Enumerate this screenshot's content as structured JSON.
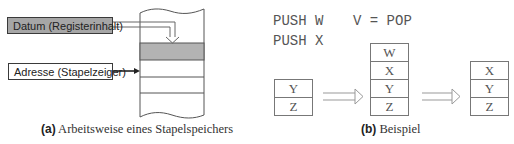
{
  "figure_a": {
    "datum_label": "Datum (Registerinhalt)",
    "address_label": "Adresse (Stapelzeiger)",
    "caption_tag": "(a)",
    "caption_text": " Arbeitsweise eines Stapelspeichers",
    "colors": {
      "datum_fill": "#a6a6a6",
      "highlight_row": "#b3b3b3"
    }
  },
  "figure_b": {
    "code": {
      "line1_left": "PUSH W",
      "line1_right": "V = POP",
      "line2": "PUSH X"
    },
    "stack_initial": [
      "Y",
      "Z"
    ],
    "stack_after_push": [
      "W",
      "X",
      "Y",
      "Z"
    ],
    "stack_after_pop": [
      "X",
      "Y",
      "Z"
    ],
    "caption_tag": "(b)",
    "caption_text": " Beispiel"
  }
}
